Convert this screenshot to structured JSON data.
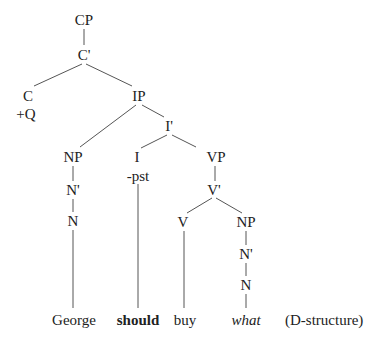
{
  "diagram": {
    "type": "syntax-tree",
    "caption": "(D-structure)",
    "nodes": {
      "cp": {
        "label": "CP",
        "x": 84,
        "y": 20
      },
      "c_bar": {
        "label": "C'",
        "x": 84,
        "y": 55
      },
      "c": {
        "label": "C",
        "x": 28,
        "y": 96
      },
      "c_feature": {
        "label": "+Q",
        "x": 26,
        "y": 114
      },
      "ip": {
        "label": "IP",
        "x": 139,
        "y": 96
      },
      "i_bar": {
        "label": "I'",
        "x": 169,
        "y": 126
      },
      "np_subj": {
        "label": "NP",
        "x": 73,
        "y": 157
      },
      "n_bar_subj": {
        "label": "N'",
        "x": 73,
        "y": 190
      },
      "n_subj": {
        "label": "N",
        "x": 73,
        "y": 221
      },
      "i": {
        "label": "I",
        "x": 137,
        "y": 157
      },
      "i_feature": {
        "label": "-pst",
        "x": 138,
        "y": 176
      },
      "vp": {
        "label": "VP",
        "x": 216,
        "y": 157
      },
      "v_bar": {
        "label": "V'",
        "x": 214,
        "y": 190
      },
      "v": {
        "label": "V",
        "x": 183,
        "y": 222
      },
      "np_obj": {
        "label": "NP",
        "x": 246,
        "y": 222
      },
      "n_bar_obj": {
        "label": "N'",
        "x": 246,
        "y": 254
      },
      "n_obj": {
        "label": "N",
        "x": 246,
        "y": 285
      }
    },
    "words": [
      {
        "text": "George",
        "x": 74,
        "y": 320,
        "style": "normal"
      },
      {
        "text": "should",
        "x": 138,
        "y": 320,
        "style": "bold"
      },
      {
        "text": "buy",
        "x": 185,
        "y": 320,
        "style": "normal"
      },
      {
        "text": "what",
        "x": 246,
        "y": 320,
        "style": "italic"
      }
    ],
    "line_color": "#555555",
    "text_color": "#222222"
  }
}
